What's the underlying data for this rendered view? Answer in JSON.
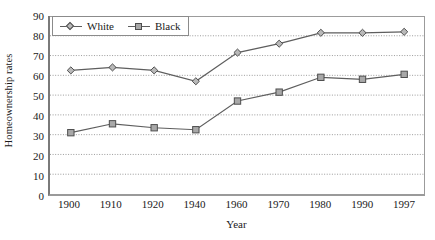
{
  "chart_data": {
    "type": "line",
    "title": "",
    "xlabel": "Year",
    "ylabel": "Homeownership rates",
    "categories": [
      "1900",
      "1910",
      "1920",
      "1940",
      "1960",
      "1970",
      "1980",
      "1990",
      "1997"
    ],
    "series": [
      {
        "name": "White",
        "marker": "diamond",
        "values": [
          62.5,
          64,
          62.5,
          57,
          71.5,
          76,
          81.5,
          81.5,
          82
        ]
      },
      {
        "name": "Black",
        "marker": "square",
        "values": [
          31,
          35.5,
          33.5,
          32.5,
          47,
          51.5,
          59,
          58,
          60.5
        ]
      }
    ],
    "ylim": [
      0,
      90
    ],
    "ytick_step": 10,
    "yticks": [
      "90",
      "80",
      "70",
      "60",
      "50",
      "40",
      "30",
      "20",
      "10",
      "0"
    ],
    "grid": true,
    "grid_axis": "y",
    "legend_position": "top-left",
    "colors": {
      "line": "#5e5e5e",
      "white_marker_fill": "#b9b9b9",
      "black_marker_fill": "#a8a8a8",
      "marker_stroke": "#4d4d4d",
      "gridline": "#9a9a9a",
      "axis": "#7a7a7a",
      "text": "#1a1a1a",
      "background": "#ffffff"
    }
  }
}
